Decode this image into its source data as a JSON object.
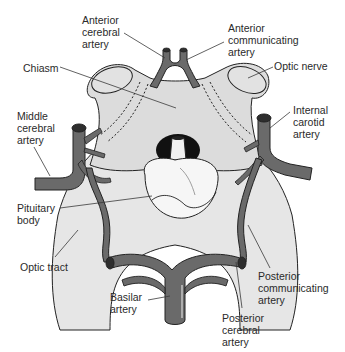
{
  "diagram": {
    "colors": {
      "background": "#ffffff",
      "nerve_fill": "#dcdcdc",
      "tract_fill": "#e6e6e6",
      "pituitary_fill": "#f6f6f6",
      "artery_fill": "#6a6a6a",
      "artery_dark": "#2e2e2e",
      "outline": "#222222",
      "leader": "#3a3a3a"
    },
    "labels": [
      {
        "id": "anterior-cerebral-artery",
        "text": "Anterior\ncerebral\nartery",
        "x": 82,
        "y": 14
      },
      {
        "id": "anterior-communicating-artery",
        "text": "Anterior\ncommunicating\nartery",
        "x": 228,
        "y": 22
      },
      {
        "id": "chiasm",
        "text": "Chiasm",
        "x": 23,
        "y": 62
      },
      {
        "id": "optic-nerve",
        "text": "Optic nerve",
        "x": 274,
        "y": 60
      },
      {
        "id": "middle-cerebral-artery",
        "text": "Middle\ncerebral\nartery",
        "x": 17,
        "y": 110
      },
      {
        "id": "internal-carotid-artery",
        "text": "Internal\ncarotid\nartery",
        "x": 293,
        "y": 104
      },
      {
        "id": "pituitary-body",
        "text": "Pituitary\nbody",
        "x": 17,
        "y": 202
      },
      {
        "id": "optic-tract",
        "text": "Optic tract",
        "x": 20,
        "y": 261
      },
      {
        "id": "basilar-artery",
        "text": "Basilar\nartery",
        "x": 110,
        "y": 291
      },
      {
        "id": "posterior-communicating-artery",
        "text": "Posterior\ncommunicating\nartery",
        "x": 258,
        "y": 270
      },
      {
        "id": "posterior-cerebral-artery",
        "text": "Posterior\ncerebral\nartery",
        "x": 222,
        "y": 312
      }
    ]
  }
}
